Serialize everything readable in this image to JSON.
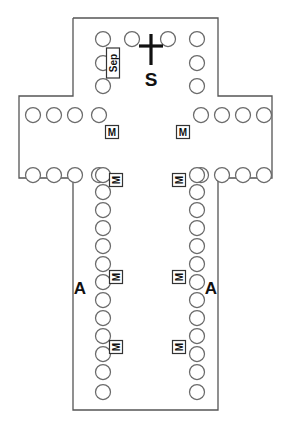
{
  "plan": {
    "name": "cruciform-church-floor-plan",
    "type": "architectural-plan",
    "background_color": "#ffffff",
    "wall_color": "#555555",
    "column_color": "#6a6a6a",
    "glyph_color": "#111111",
    "outline_points": "73,18 218,18 218,96 272,96 272,178 218,178 218,410 73,410 73,178 19,178 19,96 73,96 73,18",
    "sections": {
      "chancel": {
        "name": "chancel",
        "column_count": 8
      },
      "left_transept": {
        "name": "left-transept",
        "column_count": 8
      },
      "right_transept": {
        "name": "right-transept",
        "column_count": 8
      },
      "nave_left_colonnade": {
        "name": "nave-left-colonnade",
        "column_count": 13
      },
      "nave_right_colonnade": {
        "name": "nave-right-colonnade",
        "column_count": 13
      }
    },
    "columns": {
      "chancel": [
        {
          "cx": 103,
          "cy": 39,
          "r": 7.5
        },
        {
          "cx": 132,
          "cy": 39,
          "r": 7.5
        },
        {
          "cx": 168,
          "cy": 39,
          "r": 7.5
        },
        {
          "cx": 197,
          "cy": 39,
          "r": 7.5
        },
        {
          "cx": 103,
          "cy": 63,
          "r": 7.5
        },
        {
          "cx": 197,
          "cy": 63,
          "r": 7.5
        },
        {
          "cx": 103,
          "cy": 86,
          "r": 7.5
        },
        {
          "cx": 197,
          "cy": 86,
          "r": 7.5
        }
      ],
      "left_transept": [
        {
          "cx": 33,
          "cy": 115,
          "r": 7.5
        },
        {
          "cx": 54,
          "cy": 115,
          "r": 7.5
        },
        {
          "cx": 75,
          "cy": 115,
          "r": 7.5
        },
        {
          "cx": 99,
          "cy": 115,
          "r": 7.5
        },
        {
          "cx": 33,
          "cy": 175,
          "r": 7.5
        },
        {
          "cx": 54,
          "cy": 175,
          "r": 7.5
        },
        {
          "cx": 75,
          "cy": 175,
          "r": 7.5
        },
        {
          "cx": 99,
          "cy": 175,
          "r": 7.5
        }
      ],
      "right_transept": [
        {
          "cx": 201,
          "cy": 115,
          "r": 7.5
        },
        {
          "cx": 222,
          "cy": 115,
          "r": 7.5
        },
        {
          "cx": 243,
          "cy": 115,
          "r": 7.5
        },
        {
          "cx": 264,
          "cy": 115,
          "r": 7.5
        },
        {
          "cx": 201,
          "cy": 175,
          "r": 7.5
        },
        {
          "cx": 222,
          "cy": 175,
          "r": 7.5
        },
        {
          "cx": 243,
          "cy": 175,
          "r": 7.5
        },
        {
          "cx": 264,
          "cy": 175,
          "r": 7.5
        }
      ],
      "nave_left": [
        {
          "cx": 103,
          "cy": 175,
          "r": 7.5
        },
        {
          "cx": 103,
          "cy": 192,
          "r": 7.5
        },
        {
          "cx": 103,
          "cy": 210,
          "r": 7.5
        },
        {
          "cx": 103,
          "cy": 228,
          "r": 7.5
        },
        {
          "cx": 103,
          "cy": 246,
          "r": 7.5
        },
        {
          "cx": 103,
          "cy": 264,
          "r": 7.5
        },
        {
          "cx": 103,
          "cy": 282,
          "r": 7.5
        },
        {
          "cx": 103,
          "cy": 300,
          "r": 7.5
        },
        {
          "cx": 103,
          "cy": 318,
          "r": 7.5
        },
        {
          "cx": 103,
          "cy": 336,
          "r": 7.5
        },
        {
          "cx": 103,
          "cy": 354,
          "r": 7.5
        },
        {
          "cx": 103,
          "cy": 372,
          "r": 7.5
        },
        {
          "cx": 103,
          "cy": 392,
          "r": 7.5
        }
      ],
      "nave_right": [
        {
          "cx": 197,
          "cy": 175,
          "r": 7.5
        },
        {
          "cx": 197,
          "cy": 192,
          "r": 7.5
        },
        {
          "cx": 197,
          "cy": 210,
          "r": 7.5
        },
        {
          "cx": 197,
          "cy": 228,
          "r": 7.5
        },
        {
          "cx": 197,
          "cy": 246,
          "r": 7.5
        },
        {
          "cx": 197,
          "cy": 264,
          "r": 7.5
        },
        {
          "cx": 197,
          "cy": 282,
          "r": 7.5
        },
        {
          "cx": 197,
          "cy": 300,
          "r": 7.5
        },
        {
          "cx": 197,
          "cy": 318,
          "r": 7.5
        },
        {
          "cx": 197,
          "cy": 336,
          "r": 7.5
        },
        {
          "cx": 197,
          "cy": 354,
          "r": 7.5
        },
        {
          "cx": 197,
          "cy": 372,
          "r": 7.5
        },
        {
          "cx": 197,
          "cy": 392,
          "r": 7.5
        }
      ]
    },
    "markers": {
      "cross": {
        "label": "cross",
        "vertical": {
          "x": 151,
          "y1": 34,
          "y2": 65
        },
        "horizontal": {
          "y": 46,
          "x1": 139,
          "x2": 163
        }
      },
      "sanctuary_letter": {
        "label": "S",
        "x": 151,
        "y": 86
      },
      "sep_box": {
        "label": "Sep",
        "rotated": true,
        "x": 113,
        "y": 63,
        "width": 13,
        "height": 30
      },
      "aisle_letters": [
        {
          "label": "A",
          "x": 80,
          "y": 288,
          "side": "left"
        },
        {
          "label": "A",
          "x": 211,
          "y": 288,
          "side": "right"
        }
      ],
      "mass_boxes": [
        {
          "label": "M",
          "x": 112,
          "y": 132,
          "rotated": false,
          "location": "left-transept"
        },
        {
          "label": "M",
          "x": 183,
          "y": 132,
          "rotated": false,
          "location": "right-transept"
        },
        {
          "label": "M",
          "x": 116,
          "y": 180,
          "rotated": true,
          "location": "nave-left-upper"
        },
        {
          "label": "M",
          "x": 179,
          "y": 180,
          "rotated": true,
          "location": "nave-right-upper"
        },
        {
          "label": "M",
          "x": 116,
          "y": 277,
          "rotated": true,
          "location": "nave-left-middle"
        },
        {
          "label": "M",
          "x": 179,
          "y": 277,
          "rotated": true,
          "location": "nave-right-middle"
        },
        {
          "label": "M",
          "x": 116,
          "y": 347,
          "rotated": true,
          "location": "nave-left-lower"
        },
        {
          "label": "M",
          "x": 179,
          "y": 347,
          "rotated": true,
          "location": "nave-right-lower"
        }
      ]
    }
  }
}
